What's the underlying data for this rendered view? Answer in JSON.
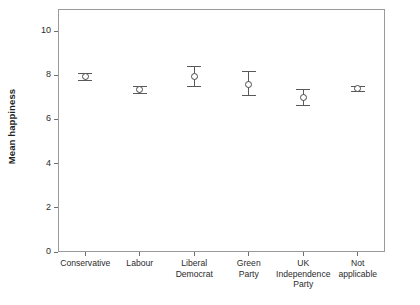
{
  "chart_data": {
    "type": "scatter",
    "title": "",
    "xlabel": "",
    "ylabel": "Mean happiness",
    "ylim": [
      0,
      11
    ],
    "yticks": [
      0,
      2,
      4,
      6,
      8,
      10
    ],
    "ytick_labels": [
      "0",
      "2",
      "4",
      "6",
      "8",
      "10"
    ],
    "grid": false,
    "legend": "none",
    "error_bars": "95% confidence interval",
    "categories": [
      "Conservative",
      "Labour",
      "Liberal\nDemocrat",
      "Green\nParty",
      "UK\nIndependence\nParty",
      "Not\napplicable"
    ],
    "values": [
      7.95,
      7.35,
      7.95,
      7.6,
      7.0,
      7.4
    ],
    "error_low": [
      7.8,
      7.2,
      7.5,
      7.1,
      6.65,
      7.3
    ],
    "error_high": [
      8.12,
      7.5,
      8.42,
      8.2,
      7.4,
      7.5
    ],
    "points": [
      {
        "category": "Conservative",
        "label": "Conservative",
        "value": 7.95,
        "low": 7.8,
        "high": 8.12
      },
      {
        "category": "Labour",
        "label": "Labour",
        "value": 7.35,
        "low": 7.2,
        "high": 7.5
      },
      {
        "category": "Liberal Democrat",
        "label": "Liberal\nDemocrat",
        "value": 7.95,
        "low": 7.5,
        "high": 8.42
      },
      {
        "category": "Green Party",
        "label": "Green\nParty",
        "value": 7.6,
        "low": 7.1,
        "high": 8.2
      },
      {
        "category": "UK Independence Party",
        "label": "UK\nIndependence\nParty",
        "value": 7.0,
        "low": 6.65,
        "high": 7.4
      },
      {
        "category": "Not applicable",
        "label": "Not\napplicable",
        "value": 7.4,
        "low": 7.3,
        "high": 7.5
      }
    ],
    "colors": {
      "marker_edge": "#4a4a4a",
      "marker_face": "#ffffff",
      "error_bar": "#585858",
      "axis": "#9a9a9a",
      "text": "#2b2b2b",
      "background": "#ffffff"
    }
  }
}
